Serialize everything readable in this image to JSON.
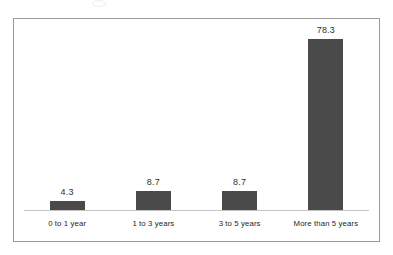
{
  "chart_data": {
    "type": "bar",
    "title": "",
    "subtitle": "",
    "xlabel": "",
    "ylabel": "",
    "categories": [
      "0 to 1 year",
      "1 to 3 years",
      "3 to 5 years",
      "More than 5 years"
    ],
    "values": [
      4.3,
      8.7,
      8.7,
      78.3
    ],
    "value_labels": [
      "4.3",
      "8.7",
      "8.7",
      "78.3"
    ],
    "ylim": [
      0,
      95
    ],
    "grid": false,
    "legend": null,
    "axis_tick_labels": [],
    "annotations": [],
    "colors": {
      "bar_fill": "#4a4a4a",
      "axis_line": "#c3c3c3",
      "frame_border": "#9a9a9a",
      "plot_background": "#ffffff",
      "value_label_text": "#2f2f2f",
      "category_label_text": "#262626"
    }
  }
}
